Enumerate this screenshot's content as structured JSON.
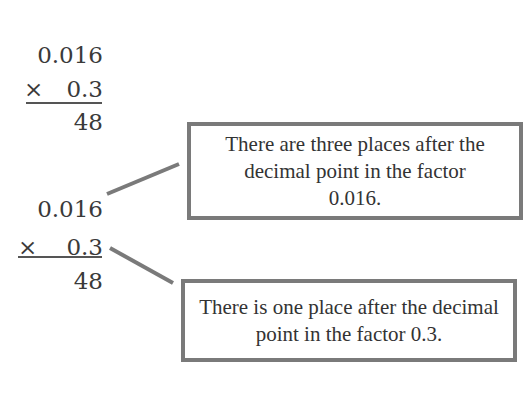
{
  "problem_top": {
    "factor1": "0.016",
    "times_sign": "×",
    "factor2": "0.3",
    "partial_product": "48"
  },
  "problem_bottom": {
    "factor1": "0.016",
    "times_sign": "×",
    "factor2": "0.3",
    "partial_product": "48"
  },
  "callouts": [
    {
      "text": "There are three places after the decimal point in the factor 0.016."
    },
    {
      "text": "There is one place after the decimal point in the factor 0.3."
    }
  ],
  "colors": {
    "box_border": "#7a7a7a",
    "connector": "#7a7a7a",
    "text": "#3a3a3a"
  }
}
